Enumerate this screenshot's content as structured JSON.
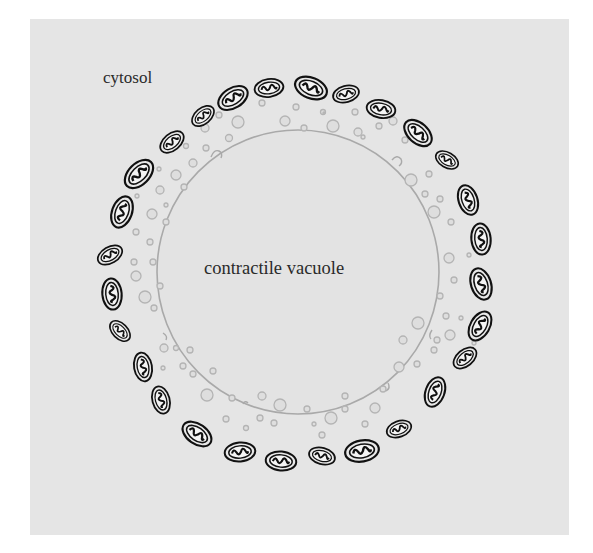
{
  "figure": {
    "labels": {
      "cytosol": "cytosol",
      "vacuole": "contractile vacuole"
    },
    "colors": {
      "background": "#ffffff",
      "panel": "#e5e5e5",
      "mitochondria_stroke": "#111111",
      "vacuole_membrane": "#a9a9a9",
      "vesicle_stroke": "#b4b4b4",
      "vesicle_fill": "#dedede",
      "text": "#2a2a2a"
    },
    "vacuole": {
      "cx": 298,
      "cy": 272,
      "rx": 141,
      "ry": 142
    },
    "mitochondria": [
      {
        "x": 172,
        "y": 142,
        "a": -40
      },
      {
        "x": 203,
        "y": 116,
        "a": -45
      },
      {
        "x": 233,
        "y": 95,
        "a": -30
      },
      {
        "x": 268,
        "y": 87,
        "a": -10
      },
      {
        "x": 310,
        "y": 87,
        "a": 20
      },
      {
        "x": 346,
        "y": 93,
        "a": -15
      },
      {
        "x": 382,
        "y": 106,
        "a": 10
      },
      {
        "x": 418,
        "y": 131,
        "a": 40
      },
      {
        "x": 447,
        "y": 162,
        "a": 35
      },
      {
        "x": 469,
        "y": 200,
        "a": 75
      },
      {
        "x": 481,
        "y": 238,
        "a": 85
      },
      {
        "x": 482,
        "y": 284,
        "a": 75
      },
      {
        "x": 481,
        "y": 325,
        "a": -60
      },
      {
        "x": 465,
        "y": 360,
        "a": -45
      },
      {
        "x": 432,
        "y": 392,
        "a": -70
      },
      {
        "x": 399,
        "y": 430,
        "a": -20
      },
      {
        "x": 362,
        "y": 451,
        "a": -10
      },
      {
        "x": 322,
        "y": 456,
        "a": 15
      },
      {
        "x": 280,
        "y": 461,
        "a": 5
      },
      {
        "x": 240,
        "y": 452,
        "a": -5
      },
      {
        "x": 197,
        "y": 434,
        "a": 35
      },
      {
        "x": 162,
        "y": 402,
        "a": 75
      },
      {
        "x": 150,
        "y": 396,
        "a": 80
      },
      {
        "x": 140,
        "y": 366,
        "a": 80
      },
      {
        "x": 120,
        "y": 330,
        "a": 45
      },
      {
        "x": 113,
        "y": 293,
        "a": 85
      },
      {
        "x": 111,
        "y": 253,
        "a": -30
      },
      {
        "x": 122,
        "y": 212,
        "a": -70
      },
      {
        "x": 139,
        "y": 174,
        "a": -45
      }
    ]
  }
}
